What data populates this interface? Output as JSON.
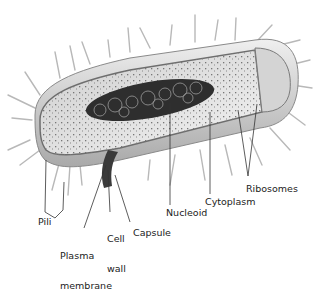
{
  "labels": {
    "pili": "Pili",
    "plasma_membrane_1": "Plasma",
    "plasma_membrane_2": "membrane",
    "cell_wall_1": "Cell",
    "cell_wall_2": "wall",
    "capsule": "Capsule",
    "nucleoid": "Nucleoid",
    "cytoplasm": "Cytoplasm",
    "ribosomes": "Ribosomes"
  },
  "colors": {
    "capsule_outer": "#d9d9d9",
    "cell_wall": "#bdbdbd",
    "cytoplasm": "#e6e6e6",
    "nucleoid": "#2a2a2a",
    "leader_line": "#333333"
  }
}
